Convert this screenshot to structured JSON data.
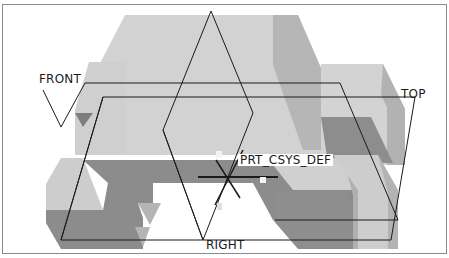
{
  "viewport": {
    "name": "3D model graphics area",
    "datum_planes": {
      "front": "FRONT",
      "top": "TOP",
      "right": "RIGHT"
    },
    "coordinate_system": "PRT_CSYS_DEF",
    "axis_labels": {
      "x": "X",
      "y": "Y",
      "z": "Z"
    }
  },
  "colors": {
    "light_face": "#d2d2d2",
    "mid_face": "#b4b4b4",
    "dark_face": "#8c8c8c",
    "edge_line": "#1a1a1a",
    "border": "#8a8a8a"
  }
}
